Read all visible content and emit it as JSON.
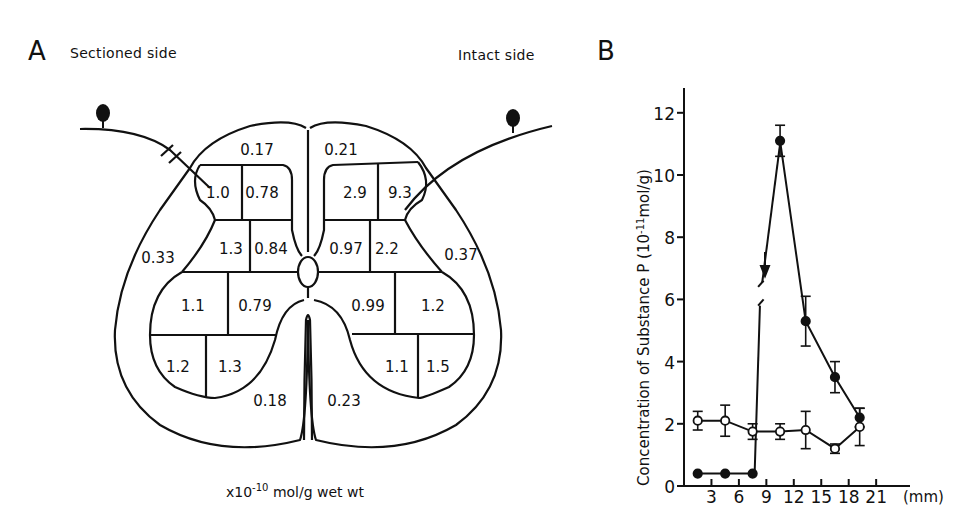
{
  "panel_a": {
    "letter": "A",
    "left_label": "Sectioned side",
    "right_label": "Intact side",
    "unit_prefix": "x10",
    "unit_exp": "-10",
    "unit_suffix": " mol/g wet wt",
    "regions": {
      "dorsal_column_left": "0.17",
      "dorsal_column_right": "0.21",
      "lamina_left_outer": "1.0",
      "lamina_left_inner": "0.78",
      "lamina_right_inner": "2.9",
      "lamina_right_outer": "9.3",
      "lateral_left": "0.33",
      "lateral_right": "0.37",
      "mid_left_outer": "1.3",
      "mid_left_inner": "0.84",
      "mid_right_inner": "0.97",
      "mid_right_outer": "2.2",
      "ventral_upper_left_outer": "1.1",
      "ventral_upper_left_inner": "0.79",
      "ventral_upper_right_inner": "0.99",
      "ventral_upper_right_outer": "1.2",
      "ventral_lower_left_outer": "1.2",
      "ventral_lower_left_inner": "1.3",
      "ventral_lower_right_inner": "1.1",
      "ventral_lower_right_outer": "1.5",
      "ventral_white_left": "0.18",
      "ventral_white_right": "0.23"
    }
  },
  "panel_b": {
    "letter": "B",
    "ylabel_main": "Concentration of Substance P (10",
    "ylabel_exp": "-11",
    "ylabel_end": "mol/g)",
    "xunit": "(mm)",
    "yticks": [
      "0",
      "2",
      "4",
      "6",
      "8",
      "10",
      "12"
    ],
    "xticks": [
      "3",
      "6",
      "9",
      "12",
      "15",
      "18",
      "21"
    ]
  },
  "chart_data": [
    {
      "type": "table",
      "title": "Substance P distribution in spinal cord cross-section (x10^-10 mol/g wet wt)",
      "columns": [
        "region",
        "sectioned_side",
        "intact_side"
      ],
      "rows": [
        [
          "dorsal column",
          0.17,
          0.21
        ],
        [
          "dorsal horn lamina (outer)",
          1.0,
          9.3
        ],
        [
          "dorsal horn lamina (inner)",
          0.78,
          2.9
        ],
        [
          "lateral funiculus",
          0.33,
          0.37
        ],
        [
          "dorsal horn mid (outer)",
          1.3,
          2.2
        ],
        [
          "dorsal horn mid (inner)",
          0.84,
          0.97
        ],
        [
          "ventral horn upper (outer)",
          1.1,
          1.2
        ],
        [
          "ventral horn upper (inner)",
          0.79,
          0.99
        ],
        [
          "ventral horn lower (outer)",
          1.2,
          1.5
        ],
        [
          "ventral horn lower (inner)",
          1.3,
          1.1
        ],
        [
          "ventral white matter",
          0.18,
          0.23
        ]
      ]
    },
    {
      "type": "line",
      "title": "",
      "xlabel": "(mm)",
      "ylabel": "Concentration of Substance P (10^-11 mol/g)",
      "xlim": [
        0,
        23
      ],
      "ylim": [
        0,
        12.8
      ],
      "xticks": [
        3,
        6,
        9,
        12,
        15,
        18,
        21
      ],
      "yticks": [
        0,
        2,
        4,
        6,
        8,
        10,
        12
      ],
      "grid": false,
      "annotations": [
        "downward arrow at ~8.5 mm (ligation site)",
        "axis break on filled series between y≈5.7 and y≈6.3"
      ],
      "series": [
        {
          "name": "filled circles (ligated/sectioned nerve)",
          "marker": "filled",
          "x": [
            1.5,
            4.5,
            7.5,
            10.5,
            13.3,
            16.5,
            19.2
          ],
          "y": [
            0.4,
            0.4,
            0.4,
            11.1,
            5.3,
            3.5,
            2.2
          ],
          "err": [
            0,
            0,
            0,
            0.5,
            0.8,
            0.5,
            0.3
          ]
        },
        {
          "name": "open circles (control)",
          "marker": "open",
          "x": [
            1.5,
            4.5,
            7.5,
            10.5,
            13.3,
            16.5,
            19.2
          ],
          "y": [
            2.1,
            2.1,
            1.75,
            1.75,
            1.8,
            1.2,
            1.9
          ],
          "err": [
            0.3,
            0.5,
            0.25,
            0.25,
            0.6,
            0.15,
            0.6
          ]
        }
      ]
    }
  ]
}
